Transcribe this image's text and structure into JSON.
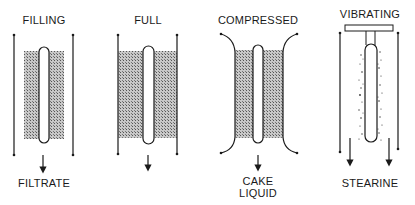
{
  "panels": [
    {
      "id": "filling",
      "title": "FILLING",
      "output": [
        "FILTRATE"
      ]
    },
    {
      "id": "full",
      "title": "FULL",
      "output": []
    },
    {
      "id": "compressed",
      "title": "COMPRESSED",
      "output": [
        "CAKE",
        "LIQUID"
      ]
    },
    {
      "id": "vibrating",
      "title": "VIBRATING",
      "output": [
        "STEARINE"
      ]
    }
  ],
  "colors": {
    "line": "#1a1a1a",
    "cake_fill": "#9a9a9a",
    "background": "#ffffff"
  }
}
